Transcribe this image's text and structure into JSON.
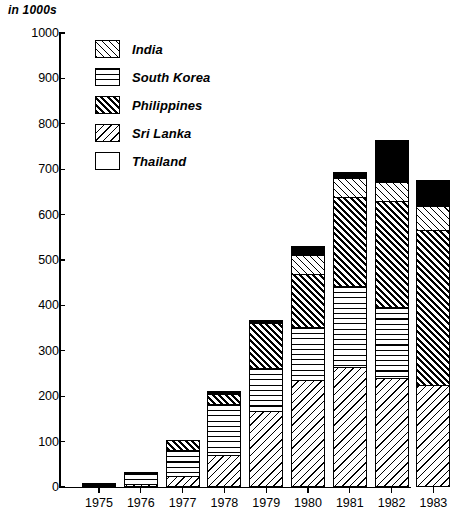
{
  "chart_data": {
    "type": "bar",
    "subtype": "stacked-vertical",
    "title": "",
    "unit_caption": "in 1000s",
    "xlabel": "",
    "ylabel": "",
    "ylim": [
      0,
      1000
    ],
    "ytick_labels": [
      "1000",
      "900",
      "800",
      "700",
      "600",
      "500",
      "400",
      "300",
      "200",
      "100",
      "0"
    ],
    "ytick_values": [
      1000,
      900,
      800,
      700,
      600,
      500,
      400,
      300,
      200,
      100,
      0
    ],
    "grid": false,
    "legend_position": "upper-left-inside",
    "categories": [
      "1975",
      "1976",
      "1977",
      "1978",
      "1979",
      "1980",
      "1981",
      "1982",
      "1983"
    ],
    "series": [
      {
        "name": "Sri Lanka",
        "pattern": "back-diagonal-hatch",
        "values": [
          0,
          3,
          25,
          70,
          168,
          235,
          265,
          240,
          225
        ]
      },
      {
        "name": "South Korea",
        "pattern": "horizontal-lines",
        "values": [
          0,
          27,
          60,
          115,
          97,
          120,
          180,
          160,
          0
        ]
      },
      {
        "name": "Philippines",
        "pattern": "dense-forward-diagonal",
        "values": [
          0,
          0,
          25,
          25,
          102,
          120,
          200,
          235,
          345
        ]
      },
      {
        "name": "India",
        "pattern": "forward-diagonal-hatch",
        "values": [
          0,
          0,
          0,
          0,
          0,
          45,
          45,
          45,
          55
        ]
      },
      {
        "name": "Thailand",
        "pattern": "solid-black",
        "values": [
          8,
          4,
          0,
          10,
          10,
          22,
          15,
          95,
          60
        ]
      }
    ],
    "totals": [
      8,
      34,
      110,
      220,
      377,
      542,
      705,
      775,
      685
    ],
    "legend_entries": [
      "India",
      "South Korea",
      "Philippines",
      "Sri Lanka",
      "Thailand"
    ]
  },
  "colors": {
    "ink": "#000000",
    "background": "#ffffff"
  }
}
